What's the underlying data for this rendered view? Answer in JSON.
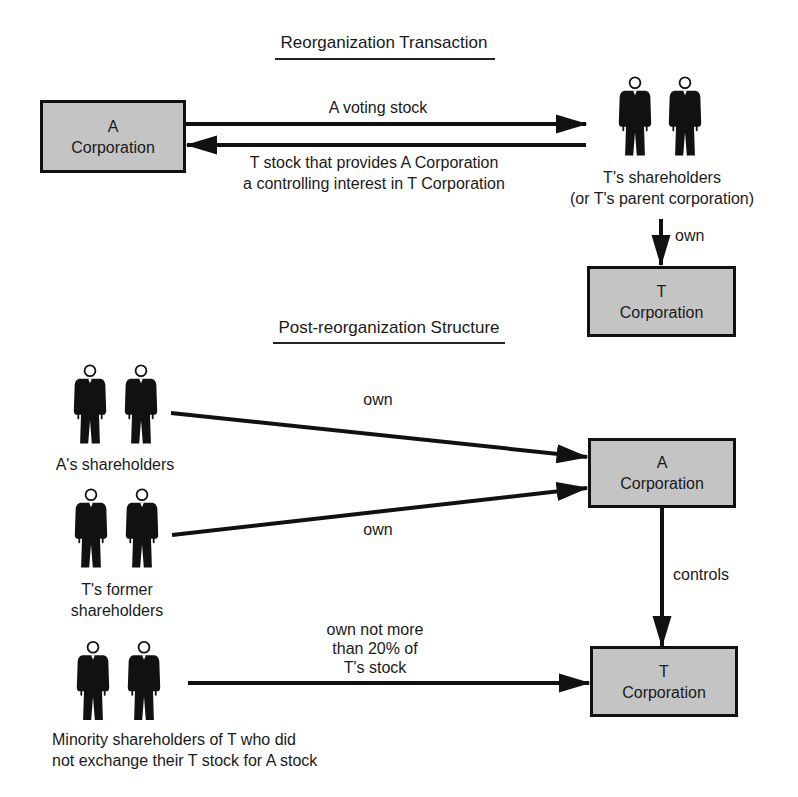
{
  "reorganization": {
    "title": "Reorganization Transaction",
    "a_corporation": {
      "line1": "A",
      "line2": "Corporation"
    },
    "t_corporation": {
      "line1": "T",
      "line2": "Corporation"
    },
    "t_shareholders": {
      "line1": "T's shareholders",
      "line2": "(or T's parent corporation)"
    },
    "arrows": {
      "a_to_t_shareholders": "A voting stock",
      "t_shareholders_to_a": {
        "line1": "T stock that provides A Corporation",
        "line2": "a controlling interest in T Corporation"
      },
      "t_shareholders_own_t": "own"
    }
  },
  "post_reorganization": {
    "title": "Post-reorganization Structure",
    "a_shareholders": {
      "label": "A's shareholders"
    },
    "t_former_shareholders": {
      "line1": "T's former",
      "line2": "shareholders"
    },
    "minority_shareholders": {
      "line1": "Minority shareholders of T who did",
      "line2": "not exchange their T stock for A stock"
    },
    "a_corporation": {
      "line1": "A",
      "line2": "Corporation"
    },
    "t_corporation": {
      "line1": "T",
      "line2": "Corporation"
    },
    "arrows": {
      "a_shareholders_own_a": "own",
      "t_former_own_a": "own",
      "a_controls_t": "controls",
      "minority_own_t": {
        "line1": "own not more",
        "line2": "than 20% of",
        "line3": "T's stock"
      }
    }
  },
  "colors": {
    "box_fill": "#c4c4c4",
    "line": "#111111",
    "text": "#1a1a1a"
  }
}
